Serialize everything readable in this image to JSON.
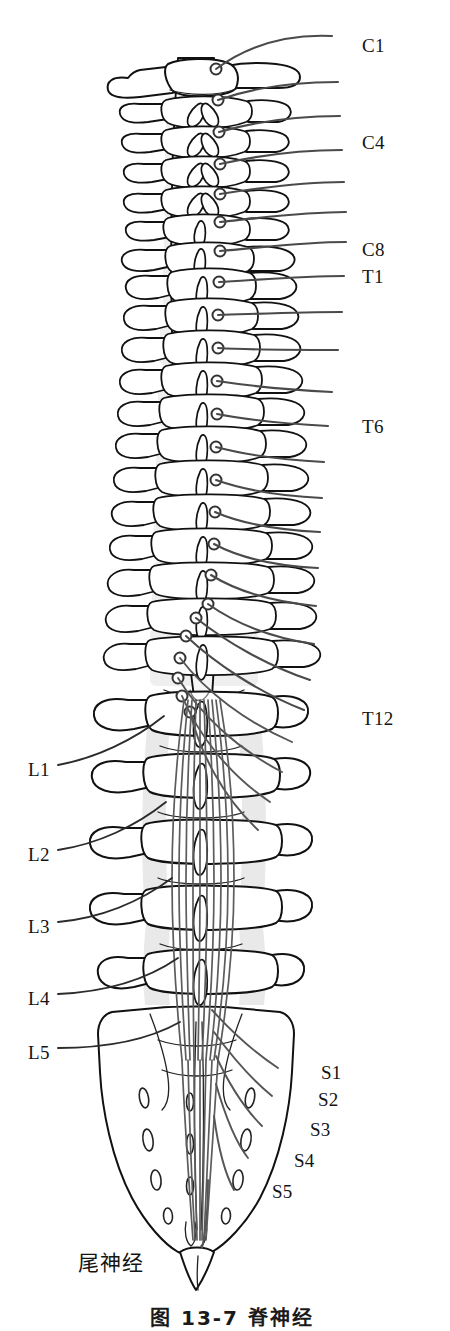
{
  "figure": {
    "alt_description": "Posterior view line drawing of the vertebral column with spinal cord and spinal nerve roots",
    "bottom_caption": "图 13-7  脊神经",
    "colors": {
      "bone_outline": "#111111",
      "bone_fill": "#ffffff",
      "bone_shading": "#e9e9e9",
      "cord_fill": "#f4f4f4",
      "nerve_stroke": "#4a4a4a",
      "cauda_stroke": "#5a5a5a",
      "ganglion_stroke": "#333333",
      "label_text": "#141414",
      "background": "#ffffff"
    }
  },
  "labels": {
    "right": [
      {
        "id": "c1",
        "text": "C1",
        "x": 362,
        "y": 36,
        "leader": true
      },
      {
        "id": "c4",
        "text": "C4",
        "x": 362,
        "y": 133,
        "leader": true
      },
      {
        "id": "c8",
        "text": "C8",
        "x": 362,
        "y": 240,
        "leader": true
      },
      {
        "id": "t1",
        "text": "T1",
        "x": 362,
        "y": 267,
        "leader": true
      },
      {
        "id": "t6",
        "text": "T6",
        "x": 362,
        "y": 417,
        "leader": true
      },
      {
        "id": "t12",
        "text": "T12",
        "x": 362,
        "y": 709,
        "leader": true
      }
    ],
    "left": [
      {
        "id": "l1",
        "text": "L1",
        "x": 28,
        "y": 760,
        "leader": true
      },
      {
        "id": "l2",
        "text": "L2",
        "x": 28,
        "y": 845,
        "leader": true
      },
      {
        "id": "l3",
        "text": "L3",
        "x": 28,
        "y": 917,
        "leader": true
      },
      {
        "id": "l4",
        "text": "L4",
        "x": 28,
        "y": 989,
        "leader": true
      },
      {
        "id": "l5",
        "text": "L5",
        "x": 28,
        "y": 1043,
        "leader": true
      }
    ],
    "sacral": [
      {
        "id": "s1",
        "text": "S1",
        "x": 321,
        "y": 1063
      },
      {
        "id": "s2",
        "text": "S2",
        "x": 318,
        "y": 1090
      },
      {
        "id": "s3",
        "text": "S3",
        "x": 310,
        "y": 1120
      },
      {
        "id": "s4",
        "text": "S4",
        "x": 294,
        "y": 1151
      },
      {
        "id": "s5",
        "text": "S5",
        "x": 272,
        "y": 1182
      }
    ],
    "coccygeal": {
      "id": "coccygeal-nerve",
      "text": "尾神经",
      "x": 78,
      "y": 1253
    }
  },
  "anatomy": {
    "regions": [
      {
        "name": "cervical",
        "label": "C1–C8",
        "vertebra_count": 7,
        "y_start": 55,
        "y_end": 250
      },
      {
        "name": "thoracic",
        "label": "T1–T12",
        "vertebra_count": 12,
        "y_start": 250,
        "y_end": 720
      },
      {
        "name": "lumbar",
        "label": "L1–L5",
        "vertebra_count": 5,
        "y_start": 720,
        "y_end": 1060
      },
      {
        "name": "sacrum",
        "label": "S1–S5",
        "vertebra_count": 5,
        "y_start": 1060,
        "y_end": 1265
      },
      {
        "name": "coccyx",
        "label": "Co",
        "vertebra_count": 1,
        "y_start": 1265,
        "y_end": 1290
      }
    ],
    "nerve_pairs": 31,
    "ganglion_count": 24,
    "sacral_foramina_rows": 4
  }
}
